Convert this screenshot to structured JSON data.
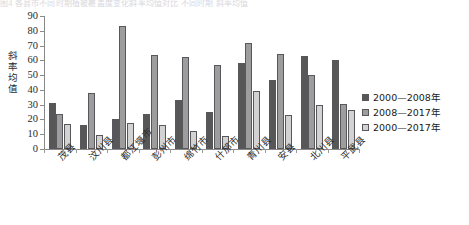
{
  "top_strip_text": "图4 各县市不同时期植被覆盖度变化斜率均值对比 不同时期 斜率均值",
  "chart_data": {
    "type": "bar",
    "title": "",
    "xlabel": "",
    "ylabel": "斜率均值",
    "ylim": [
      0,
      90
    ],
    "yticks": [
      0,
      10,
      20,
      30,
      40,
      50,
      60,
      70,
      80,
      90
    ],
    "grid": false,
    "legend_position": "right",
    "categories": [
      "茂县",
      "汶川县",
      "都江堰市",
      "彭州市",
      "绵竹市",
      "什邡市",
      "青川县",
      "安县",
      "北川县",
      "平武县"
    ],
    "series": [
      {
        "name": "2000—2008年",
        "color": "#575757",
        "values": [
          31,
          16,
          20.5,
          24,
          33.5,
          25,
          58,
          46.5,
          63,
          60.5
        ]
      },
      {
        "name": "2008—2017年",
        "color": "#9d9d9d",
        "values": [
          24,
          38,
          83,
          63.5,
          62.5,
          57,
          72,
          64,
          50,
          30.5
        ]
      },
      {
        "name": "2000—2017年",
        "color": "#d2d2d2",
        "values": [
          17,
          9.5,
          17.5,
          16,
          12.5,
          9,
          39.5,
          23,
          29.5,
          26.5
        ]
      }
    ]
  },
  "y_axis_title_chars": [
    "斜",
    "率",
    "均",
    "值"
  ],
  "legend": {
    "items": [
      {
        "label": "2000—2008年",
        "color": "#575757"
      },
      {
        "label": "2008—2017年",
        "color": "#9d9d9d"
      },
      {
        "label": "2000—2017年",
        "color": "#d2d2d2"
      }
    ]
  }
}
